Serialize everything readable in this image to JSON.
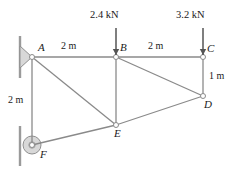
{
  "figure": {
    "type": "truss-free-body-diagram",
    "title": "",
    "units": "m",
    "force_units": "kN"
  },
  "joints": [
    {
      "id": "A",
      "label": "A",
      "x": 32,
      "y": 57,
      "support": "pin",
      "label_dx": 6,
      "label_dy": -15
    },
    {
      "id": "B",
      "label": "B",
      "x": 116,
      "y": 57,
      "support": "none",
      "label_dx": 4,
      "label_dy": -15
    },
    {
      "id": "C",
      "label": "C",
      "x": 203,
      "y": 57,
      "support": "none",
      "label_dx": 4,
      "label_dy": -14
    },
    {
      "id": "D",
      "label": "D",
      "x": 203,
      "y": 96,
      "support": "none",
      "label_dx": 1,
      "label_dy": 3
    },
    {
      "id": "E",
      "label": "E",
      "x": 116,
      "y": 125,
      "support": "none",
      "label_dx": -2,
      "label_dy": 3
    },
    {
      "id": "F",
      "label": "F",
      "x": 32,
      "y": 145,
      "support": "roller",
      "label_dx": 8,
      "label_dy": 4
    }
  ],
  "members": [
    {
      "from": "A",
      "to": "B"
    },
    {
      "from": "B",
      "to": "C"
    },
    {
      "from": "A",
      "to": "F"
    },
    {
      "from": "A",
      "to": "E"
    },
    {
      "from": "B",
      "to": "E"
    },
    {
      "from": "B",
      "to": "D"
    },
    {
      "from": "C",
      "to": "D"
    },
    {
      "from": "D",
      "to": "E"
    },
    {
      "from": "F",
      "to": "E"
    }
  ],
  "loads": [
    {
      "id": "load-B",
      "magnitude": "2.4 kN",
      "at_joint": "B",
      "direction": "down",
      "arrow_x": 116,
      "arrow_top": 28,
      "arrow_bottom": 55,
      "label_x": 90,
      "label_y": 10
    },
    {
      "id": "load-C",
      "magnitude": "3.2 kN",
      "at_joint": "C",
      "direction": "down",
      "arrow_x": 203,
      "arrow_top": 28,
      "arrow_bottom": 55,
      "label_x": 176,
      "label_y": 10
    }
  ],
  "dimensions": [
    {
      "id": "dim-AB",
      "text": "2 m",
      "label_x": 61,
      "label_y": 41,
      "span": "A-B"
    },
    {
      "id": "dim-BC",
      "text": "2 m",
      "label_x": 148,
      "label_y": 41,
      "span": "B-C"
    },
    {
      "id": "dim-CD",
      "text": "1 m",
      "label_x": 209,
      "label_y": 71,
      "span": "C-D"
    },
    {
      "id": "dim-AF",
      "text": "2 m",
      "label_x": 8,
      "label_y": 95,
      "span": "A-F"
    }
  ],
  "supports": {
    "pin": {
      "id": "support-A",
      "joint": "A",
      "wall_x": 20,
      "wall_top": 36,
      "wall_bottom": 78,
      "type": "pinned-wall"
    },
    "roller": {
      "id": "support-F",
      "joint": "F",
      "wall_x": 20,
      "wall_top": 126,
      "wall_bottom": 166,
      "radius": 9,
      "type": "roller-wall"
    }
  },
  "colors": {
    "member": "#8a8a8a",
    "node_stroke": "#8a8a8a",
    "node_fill": "#ffffff",
    "arrow": "#555555",
    "wall": "#9a9a9a",
    "text": "#1a1a1a",
    "support_fill": "#d8d8d8"
  }
}
